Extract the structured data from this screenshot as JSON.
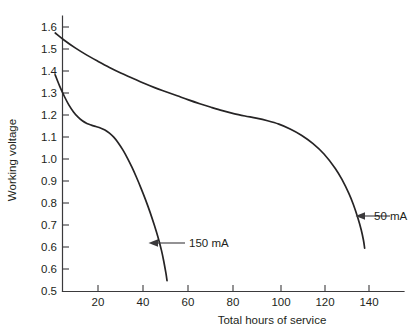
{
  "chart_data": {
    "type": "line",
    "title": "",
    "xlabel": "Total hours of service",
    "ylabel": "Working voltage",
    "xlim": [
      0,
      155
    ],
    "ylim": [
      0.5,
      1.65
    ],
    "grid": false,
    "legend_position": "inline-annotations",
    "x_ticks": [
      20,
      40,
      60,
      80,
      100,
      120,
      140
    ],
    "x_tick_labels": [
      "20",
      "40",
      "60",
      "80",
      "100",
      "120",
      "140"
    ],
    "y_ticks": [
      0.5,
      0.6,
      0.7,
      0.8,
      0.9,
      1.0,
      1.1,
      1.2,
      1.3,
      1.4,
      1.5,
      1.6
    ],
    "y_tick_labels": [
      "0.5",
      "0.6",
      "0.7",
      "0.8",
      "0.9",
      "1.0",
      "1.1",
      "1.2",
      "1.3",
      "1.4",
      "1.5",
      "1.6"
    ],
    "series": [
      {
        "name": "50 mA",
        "label": "50 mA",
        "color": "#262425",
        "points": [
          [
            1,
            1.575
          ],
          [
            5,
            1.545
          ],
          [
            10,
            1.512
          ],
          [
            15,
            1.483
          ],
          [
            20,
            1.457
          ],
          [
            25,
            1.432
          ],
          [
            30,
            1.409
          ],
          [
            35,
            1.388
          ],
          [
            40,
            1.367
          ],
          [
            45,
            1.348
          ],
          [
            50,
            1.331
          ],
          [
            55,
            1.314
          ],
          [
            60,
            1.297
          ],
          [
            65,
            1.281
          ],
          [
            70,
            1.266
          ],
          [
            75,
            1.252
          ],
          [
            80,
            1.24
          ],
          [
            85,
            1.23
          ],
          [
            90,
            1.221
          ],
          [
            95,
            1.21
          ],
          [
            100,
            1.196
          ],
          [
            105,
            1.176
          ],
          [
            110,
            1.15
          ],
          [
            115,
            1.116
          ],
          [
            120,
            1.072
          ],
          [
            125,
            1.012
          ],
          [
            128,
            0.965
          ],
          [
            131,
            0.908
          ],
          [
            133,
            0.862
          ],
          [
            135,
            0.806
          ],
          [
            136.5,
            0.756
          ],
          [
            137.5,
            0.712
          ],
          [
            138,
            0.68
          ]
        ]
      },
      {
        "name": "150 mA",
        "label": "150 mA",
        "color": "#262425",
        "points": [
          [
            1,
            1.4
          ],
          [
            3,
            1.353
          ],
          [
            5,
            1.312
          ],
          [
            7,
            1.276
          ],
          [
            9,
            1.248
          ],
          [
            11,
            1.226
          ],
          [
            13,
            1.21
          ],
          [
            15,
            1.199
          ],
          [
            17,
            1.192
          ],
          [
            19,
            1.186
          ],
          [
            21,
            1.18
          ],
          [
            23,
            1.172
          ],
          [
            25,
            1.159
          ],
          [
            27,
            1.141
          ],
          [
            29,
            1.117
          ],
          [
            31,
            1.088
          ],
          [
            33,
            1.054
          ],
          [
            35,
            1.016
          ],
          [
            37,
            0.974
          ],
          [
            39,
            0.929
          ],
          [
            41,
            0.881
          ],
          [
            43,
            0.829
          ],
          [
            45,
            0.772
          ],
          [
            46.5,
            0.726
          ],
          [
            48,
            0.672
          ],
          [
            49,
            0.628
          ],
          [
            50,
            0.576
          ],
          [
            50.5,
            0.545
          ]
        ]
      }
    ],
    "annotations": [
      {
        "text": "150 mA",
        "points_to_series": "150 mA",
        "arrow_direction": "left"
      },
      {
        "text": "50 mA",
        "points_to_series": "50 mA",
        "arrow_direction": "left"
      }
    ]
  }
}
